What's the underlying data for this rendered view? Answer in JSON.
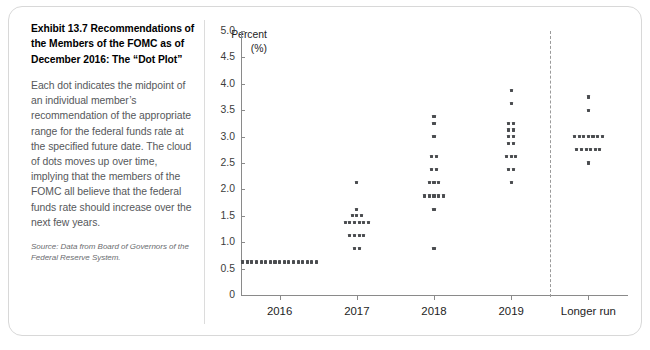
{
  "exhibit": {
    "title": "Exhibit 13.7  Recommendations of the Members of the FOMC as of December 2016: The “Dot Plot”",
    "body": "Each dot indicates the midpoint of an individual member’s recommendation of the appropriate range for the federal funds rate at the specified future date. The cloud of dots moves up over time, implying that the members of the FOMC all believe that the federal funds rate should increase over the next few years.",
    "source": "Source: Data from Board of Governors of the Federal Reserve System."
  },
  "chart_data": {
    "type": "scatter",
    "title": "",
    "xlabel": "",
    "ylabel": "Percent (%)",
    "ylim": [
      0,
      5.0
    ],
    "ytick_labels": [
      "5.0",
      "4.5",
      "4.0",
      "3.5",
      "3.0",
      "2.5",
      "2.0",
      "1.5",
      "1.0",
      "0.5",
      "0"
    ],
    "ytick_values": [
      5.0,
      4.5,
      4.0,
      3.5,
      3.0,
      2.5,
      2.0,
      1.5,
      1.0,
      0.5,
      0
    ],
    "grid": false,
    "legend": false,
    "categories": [
      "2016",
      "2017",
      "2018",
      "2019",
      "Longer run"
    ],
    "separator_after_category": "2019",
    "dot_color": "#4b4d50",
    "axis_color": "#8a8a8a",
    "series": [
      {
        "name": "2016",
        "points": [
          {
            "value": 0.625,
            "count": 17
          }
        ]
      },
      {
        "name": "2017",
        "points": [
          {
            "value": 2.125,
            "count": 1
          },
          {
            "value": 1.625,
            "count": 1
          },
          {
            "value": 1.5,
            "count": 3
          },
          {
            "value": 1.375,
            "count": 6
          },
          {
            "value": 1.125,
            "count": 4
          },
          {
            "value": 0.875,
            "count": 2
          }
        ]
      },
      {
        "name": "2018",
        "points": [
          {
            "value": 3.375,
            "count": 1
          },
          {
            "value": 3.25,
            "count": 1
          },
          {
            "value": 3.0,
            "count": 1
          },
          {
            "value": 2.625,
            "count": 2
          },
          {
            "value": 2.375,
            "count": 2
          },
          {
            "value": 2.125,
            "count": 3
          },
          {
            "value": 1.875,
            "count": 5
          },
          {
            "value": 1.625,
            "count": 1
          },
          {
            "value": 0.875,
            "count": 1
          }
        ]
      },
      {
        "name": "2019",
        "points": [
          {
            "value": 3.875,
            "count": 1
          },
          {
            "value": 3.625,
            "count": 1
          },
          {
            "value": 3.25,
            "count": 2
          },
          {
            "value": 3.125,
            "count": 2
          },
          {
            "value": 3.0,
            "count": 2
          },
          {
            "value": 2.875,
            "count": 2
          },
          {
            "value": 2.625,
            "count": 3
          },
          {
            "value": 2.375,
            "count": 2
          },
          {
            "value": 2.125,
            "count": 1
          }
        ]
      },
      {
        "name": "Longer run",
        "points": [
          {
            "value": 3.75,
            "count": 1
          },
          {
            "value": 3.5,
            "count": 1
          },
          {
            "value": 3.0,
            "count": 7
          },
          {
            "value": 2.75,
            "count": 6
          },
          {
            "value": 2.5,
            "count": 1
          }
        ]
      }
    ]
  }
}
